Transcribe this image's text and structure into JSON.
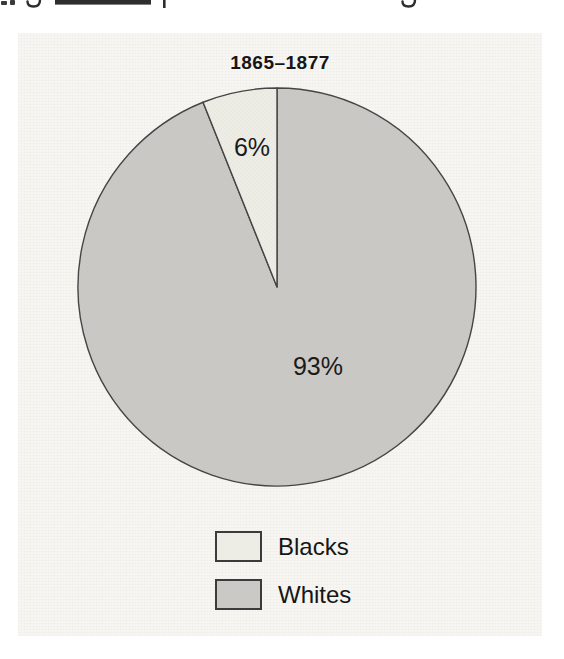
{
  "page": {
    "background_color": "#ffffff",
    "paper_panel_color": "#f7f6f2"
  },
  "chart_data": {
    "type": "pie",
    "title": "1865–1877",
    "categories": [
      "Blacks",
      "Whites"
    ],
    "values": [
      6,
      93
    ],
    "segments": [
      {
        "label": "Whites",
        "value": 93,
        "display_label": "93%",
        "color": "#cac9c5",
        "label_x": 318,
        "label_y": 375,
        "label_font_px": 25
      },
      {
        "label": "Blacks",
        "value": 6,
        "display_label": "6%",
        "color": "#eeede5",
        "label_x": 252,
        "label_y": 156,
        "label_font_px": 25
      }
    ],
    "draw": {
      "cx": 277,
      "cy": 287,
      "r": 199,
      "start_angle_deg": -90,
      "direction": "clockwise",
      "stroke_color": "#454545",
      "stroke_width": 1.4,
      "label_color": "#1a1a1a"
    },
    "legend": {
      "position": "bottom-center",
      "entries": [
        {
          "label": "Blacks",
          "color": "#eeede5"
        },
        {
          "label": "Whites",
          "color": "#cac9c5"
        }
      ]
    }
  }
}
